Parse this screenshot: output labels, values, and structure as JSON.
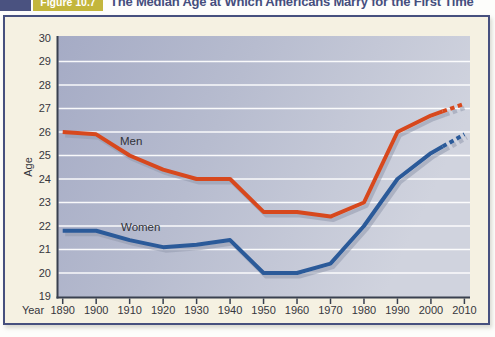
{
  "figure": {
    "badge": "Figure 10.7",
    "title": "The Median Age at Which Americans Marry for the First Time"
  },
  "chart_data": {
    "type": "line",
    "title": "The Median Age at Which Americans Marry for the First Time",
    "xlabel": "Year",
    "ylabel": "Age",
    "ylim": [
      19,
      30
    ],
    "yticks": [
      30,
      29,
      28,
      27,
      26,
      25,
      24,
      23,
      22,
      21,
      20,
      19
    ],
    "x": [
      1890,
      1900,
      1910,
      1920,
      1930,
      1940,
      1950,
      1960,
      1970,
      1980,
      1990,
      2000,
      2010
    ],
    "grid": "white horizontal gridlines at each age",
    "legend_position": "inline labels on lines",
    "dashed_note_year": 2000,
    "series": [
      {
        "name": "Men",
        "color": "#d7481d",
        "values": [
          26.0,
          25.9,
          25.0,
          24.4,
          24.0,
          24.0,
          22.6,
          22.6,
          22.4,
          23.0,
          26.0,
          26.7,
          27.2
        ],
        "dashed_from_year": 2000
      },
      {
        "name": "Women",
        "color": "#2b5a99",
        "values": [
          21.8,
          21.8,
          21.4,
          21.1,
          21.2,
          21.4,
          20.0,
          20.0,
          20.4,
          22.0,
          24.0,
          25.1,
          25.9
        ],
        "dashed_from_year": 2000
      }
    ]
  }
}
